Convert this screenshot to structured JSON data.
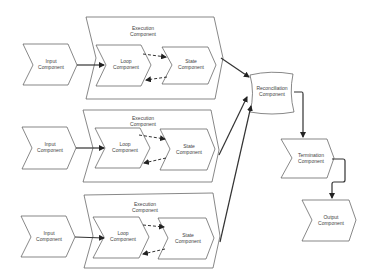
{
  "diagram": {
    "pipelines": [
      {
        "input": {
          "line1": "Input",
          "line2": "Component"
        },
        "execution": {
          "line1": "Execution",
          "line2": "Component"
        },
        "loop": {
          "line1": "Loop",
          "line2": "Component"
        },
        "state": {
          "line1": "State",
          "line2": "Component"
        }
      },
      {
        "input": {
          "line1": "Input",
          "line2": "Component"
        },
        "execution": {
          "line1": "Execution",
          "line2": "Component"
        },
        "loop": {
          "line1": "Loop",
          "line2": "Component"
        },
        "state": {
          "line1": "State",
          "line2": "Component"
        }
      },
      {
        "input": {
          "line1": "Input",
          "line2": "Component"
        },
        "execution": {
          "line1": "Execution",
          "line2": "Component"
        },
        "loop": {
          "line1": "Loop",
          "line2": "Component"
        },
        "state": {
          "line1": "State",
          "line2": "Component"
        }
      }
    ],
    "reconciliation": {
      "line1": "Reconciliation",
      "line2": "Component"
    },
    "termination": {
      "line1": "Termination",
      "line2": "Component"
    },
    "output": {
      "line1": "Output",
      "line2": "Component"
    },
    "colors": {
      "stroke": "#555555",
      "arrow": "#333333",
      "background": "#ffffff"
    }
  }
}
